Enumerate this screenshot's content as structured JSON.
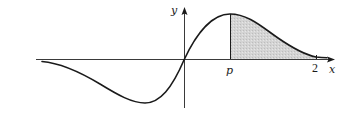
{
  "diagram": {
    "type": "function-graph",
    "axes": {
      "x_label": "x",
      "y_label": "y"
    },
    "markers": {
      "p_label": "p",
      "two_label": "2"
    },
    "shaded_region": {
      "from": "p",
      "to": "2",
      "fill_color": "#cfcfcf"
    },
    "colors": {
      "curve": "#1a1a1a",
      "axis": "#3a3a3a",
      "shade": "#cfcfcf"
    }
  }
}
